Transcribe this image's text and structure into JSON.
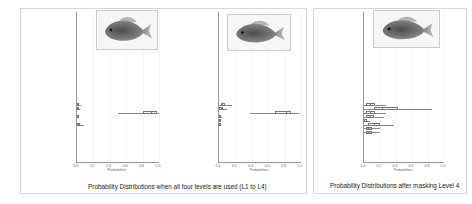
{
  "figures": [
    {
      "caption": "Probability Distributions when all four levels are used (L1 to L4)"
    },
    {
      "caption": "Probability Distributions after masking Level 4"
    }
  ],
  "xlabel": "Probabilities",
  "xticks": [
    "0.0",
    "0.2",
    "0.4",
    "0.6",
    "0.8",
    "1.0"
  ],
  "species": [
    "Phenacobius mirabilis",
    "Notropis nocturnus",
    "Notropis rubellus",
    "Notropis girardi",
    "Notropis texanus",
    "Notropis atherinoides",
    "Notropis wickliffi",
    "Notropis volucellus",
    "Notropis buccatus",
    "Notropis telescopus",
    "Notropis amnis",
    "Notropis percobromus",
    "Notropis nubilus",
    "Notropis baileyi",
    "Notropis hudsonius",
    "Notropis dorsalis",
    "Notropis buchanani",
    "Notropis boops",
    "Notropis blennius",
    "Notropis stramineus",
    "Notropis atherinoides",
    "Morone mississippiensis",
    "Morone chrysops",
    "Lepomis microlophus",
    "Lepomis megalotis",
    "Lepomis macrochirus",
    "Lepomis humilis",
    "Lepomis gulosus",
    "Lepomis gibbosus",
    "Lepomis cyanellus",
    "Lepomis auritus",
    "Lepisosteus platostomus",
    "Lepisosteus osseus",
    "Gambusia affinis",
    "Esox americanus",
    "Cyprinus carpio",
    "Carassius auratus",
    "Alosa chrysochloris"
  ],
  "chart_data": [
    {
      "type": "boxplot",
      "title": "Probability Distributions when all four levels are used (L1 to L4) - panel A",
      "xlabel": "Probabilities",
      "xlim": [
        0,
        1
      ],
      "orientation": "horizontal",
      "boxes": [
        {
          "species": "Lepomis microlophus",
          "q1": 0.0,
          "median": 0.01,
          "q3": 0.03,
          "whisker_low": 0.0,
          "whisker_high": 0.05
        },
        {
          "species": "Lepomis megalotis",
          "q1": 0.0,
          "median": 0.005,
          "q3": 0.02,
          "whisker_low": 0.0,
          "whisker_high": 0.04
        },
        {
          "species": "Lepomis macrochirus",
          "q1": 0.8,
          "median": 0.9,
          "q3": 0.98,
          "whisker_low": 0.5,
          "whisker_high": 1.0
        },
        {
          "species": "Lepomis humilis",
          "q1": 0.0,
          "median": 0.005,
          "q3": 0.015,
          "whisker_low": 0.0,
          "whisker_high": 0.03
        },
        {
          "species": "Lepomis gibbosus",
          "q1": 0.0,
          "median": 0.01,
          "q3": 0.04,
          "whisker_low": 0.0,
          "whisker_high": 0.08
        }
      ]
    },
    {
      "type": "boxplot",
      "title": "Probability Distributions when all four levels are used (L1 to L4) - panel B",
      "xlabel": "Probabilities",
      "xlim": [
        0,
        1
      ],
      "orientation": "horizontal",
      "boxes": [
        {
          "species": "Lepomis microlophus",
          "q1": 0.02,
          "median": 0.04,
          "q3": 0.07,
          "whisker_low": 0.0,
          "whisker_high": 0.16
        },
        {
          "species": "Lepomis megalotis",
          "q1": 0.0,
          "median": 0.02,
          "q3": 0.05,
          "whisker_low": 0.0,
          "whisker_high": 0.1
        },
        {
          "species": "Lepomis macrochirus",
          "q1": 0.68,
          "median": 0.82,
          "q3": 0.88,
          "whisker_low": 0.38,
          "whisker_high": 0.98
        },
        {
          "species": "Lepomis humilis",
          "q1": 0.0,
          "median": 0.005,
          "q3": 0.02,
          "whisker_low": 0.0,
          "whisker_high": 0.04
        },
        {
          "species": "Lepomis gulosus",
          "q1": 0.0,
          "median": 0.005,
          "q3": 0.015,
          "whisker_low": 0.0,
          "whisker_high": 0.03
        },
        {
          "species": "Lepomis gibbosus",
          "q1": 0.0,
          "median": 0.005,
          "q3": 0.015,
          "whisker_low": 0.0,
          "whisker_high": 0.03
        }
      ]
    },
    {
      "type": "boxplot",
      "title": "Probability Distributions after masking Level 4",
      "xlabel": "Probabilities",
      "xlim": [
        0,
        1
      ],
      "orientation": "horizontal",
      "boxes": [
        {
          "species": "Lepomis microlophus",
          "q1": 0.03,
          "median": 0.08,
          "q3": 0.14,
          "whisker_low": 0.0,
          "whisker_high": 0.28
        },
        {
          "species": "Lepomis megalotis",
          "q1": 0.12,
          "median": 0.22,
          "q3": 0.42,
          "whisker_low": 0.0,
          "whisker_high": 0.85
        },
        {
          "species": "Lepomis macrochirus",
          "q1": 0.03,
          "median": 0.07,
          "q3": 0.14,
          "whisker_low": 0.0,
          "whisker_high": 0.28
        },
        {
          "species": "Lepomis humilis",
          "q1": 0.03,
          "median": 0.08,
          "q3": 0.13,
          "whisker_low": 0.0,
          "whisker_high": 0.25
        },
        {
          "species": "Lepomis gulosus",
          "q1": 0.0,
          "median": 0.02,
          "q3": 0.04,
          "whisker_low": 0.0,
          "whisker_high": 0.08
        },
        {
          "species": "Lepomis gibbosus",
          "q1": 0.05,
          "median": 0.12,
          "q3": 0.2,
          "whisker_low": 0.0,
          "whisker_high": 0.38
        },
        {
          "species": "Lepomis cyanellus",
          "q1": 0.02,
          "median": 0.05,
          "q3": 0.1,
          "whisker_low": 0.0,
          "whisker_high": 0.2
        },
        {
          "species": "Lepomis auritus",
          "q1": 0.02,
          "median": 0.05,
          "q3": 0.1,
          "whisker_low": 0.0,
          "whisker_high": 0.2
        }
      ]
    }
  ]
}
